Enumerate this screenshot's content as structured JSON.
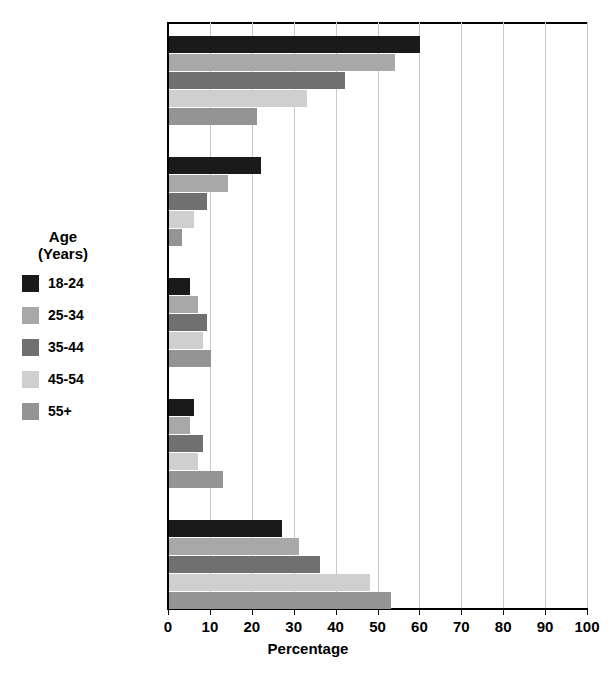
{
  "chart_data": {
    "type": "bar",
    "orientation": "horizontal",
    "title": "",
    "xlabel": "Percentage",
    "ylabel": "",
    "xlim": [
      0,
      100
    ],
    "xticks": [
      0,
      10,
      20,
      30,
      40,
      50,
      60,
      70,
      80,
      90,
      100
    ],
    "grid": true,
    "legend_position": "left-outside",
    "legend_title": "Age\n(Years)",
    "categories": [
      "Online",
      "Social\nMedia",
      "Radio",
      "Print",
      "Television"
    ],
    "series": [
      {
        "name": "18-24",
        "color": "#1a1a1a",
        "values": [
          60,
          22,
          5,
          6,
          27
        ]
      },
      {
        "name": "25-34",
        "color": "#a8a8a8",
        "values": [
          54,
          14,
          7,
          5,
          31
        ]
      },
      {
        "name": "35-44",
        "color": "#707070",
        "values": [
          42,
          9,
          9,
          8,
          36
        ]
      },
      {
        "name": "45-54",
        "color": "#cfcfcf",
        "values": [
          33,
          6,
          8,
          7,
          48
        ]
      },
      {
        "name": "55+",
        "color": "#949494",
        "values": [
          21,
          3,
          10,
          13,
          53
        ]
      }
    ]
  },
  "axis": {
    "x_title": "Percentage",
    "tick_labels": [
      "0",
      "10",
      "20",
      "30",
      "40",
      "50",
      "60",
      "70",
      "80",
      "90",
      "100"
    ]
  },
  "legend": {
    "title": "Age\n(Years)",
    "items": [
      {
        "label": "18-24",
        "color": "#1a1a1a"
      },
      {
        "label": "25-34",
        "color": "#a8a8a8"
      },
      {
        "label": "35-44",
        "color": "#707070"
      },
      {
        "label": "45-54",
        "color": "#cfcfcf"
      },
      {
        "label": "55+",
        "color": "#949494"
      }
    ]
  }
}
